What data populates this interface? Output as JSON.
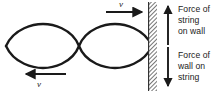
{
  "figure": {
    "type": "physics-diagram",
    "background_color": "#ffffff",
    "ink_color": "#1a1a1a"
  },
  "wave": {
    "name": "standing-wave",
    "loops": 3,
    "node_count": 4,
    "description": "standing wave with three antinode loops between four nodes",
    "x_start": 6,
    "x_end": 152,
    "axis_y": 46,
    "amplitude": 21,
    "stroke_width": 2.4
  },
  "wall": {
    "name": "wall",
    "x": 148,
    "y": 2,
    "width": 9,
    "height": 89,
    "hatch_angle_deg": 45,
    "hatch_color": "#333333"
  },
  "forces": [
    {
      "name": "force-of-string-on-wall",
      "direction": "up",
      "lines": [
        "Force of",
        "string",
        "on wall"
      ],
      "text": "Force of string on wall"
    },
    {
      "name": "force-of-wall-on-string",
      "direction": "down",
      "lines": [
        "Force of",
        "wall on",
        "string"
      ],
      "text": "Force of wall on string"
    }
  ],
  "velocities": [
    {
      "name": "velocity-top",
      "label": "v",
      "direction": "right",
      "arrow_x_start": 106,
      "arrow_x_end": 144,
      "arrow_y": 12
    },
    {
      "name": "velocity-bottom",
      "label": "v",
      "direction": "left",
      "arrow_x_start": 66,
      "arrow_x_end": 24,
      "arrow_y": 74
    }
  ],
  "force_arrows": {
    "up_arrow": {
      "x": 168,
      "y_tail": 44,
      "y_head": 4
    },
    "down_arrow": {
      "x": 168,
      "y_tail": 48,
      "y_head": 88
    }
  }
}
